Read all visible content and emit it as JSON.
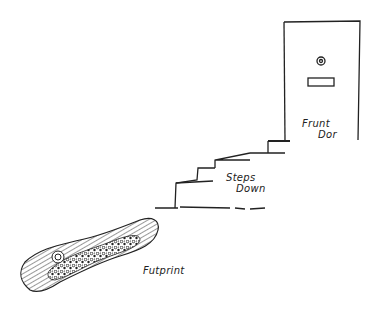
{
  "labels": {
    "door_line1": "Frunt",
    "door_line2": "Dor",
    "steps_line1": "Steps",
    "steps_line2": "Down",
    "footprint": "Futprint"
  },
  "colors": {
    "ink": "#222222",
    "background": "#ffffff"
  }
}
